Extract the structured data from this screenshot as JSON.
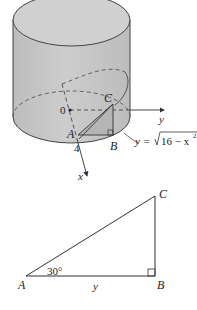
{
  "figure_3d": {
    "origin_label": "0",
    "point_a": "A",
    "point_b": "B",
    "point_c": "C",
    "tick_label": "4",
    "x_axis_label": "x",
    "y_axis_label": "y",
    "curve_label_prefix": "y = ",
    "curve_label_radicand": "16 − x",
    "curve_label_exponent": "2"
  },
  "triangle": {
    "vertex_a": "A",
    "vertex_b": "B",
    "vertex_c": "C",
    "angle_label": "30°",
    "side_label": "y"
  },
  "colors": {
    "cylinder_fill": "#c8c8c8",
    "cylinder_top": "#cfcfcf",
    "stroke": "#333333",
    "inner_triangle": "#b8b8b8"
  }
}
